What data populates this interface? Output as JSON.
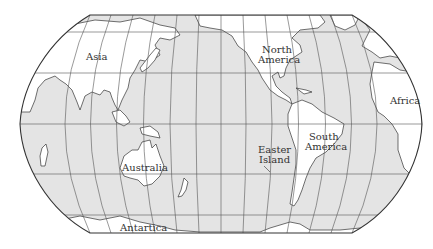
{
  "map": {
    "projection": "Pacific-centered world map (Robinson-like, flat poles)",
    "colors": {
      "ocean": "#e4e4e4",
      "land": "#ffffff",
      "coastline": "#333333",
      "graticule": "#555555",
      "border": "#333333",
      "background": "#ffffff"
    },
    "labels": {
      "asia": "Asia",
      "north_america": "North America",
      "north_america_line1": "North",
      "north_america_line2": "America",
      "africa": "Africa",
      "australia": "Australia",
      "south_america_line1": "South",
      "south_america_line2": "America",
      "easter_island_line1": "Easter",
      "easter_island_line2": "Island",
      "antarctica": "Antartica"
    },
    "graticule": {
      "parallels_y": [
        32,
        73,
        124,
        174,
        215
      ],
      "meridian_count": 12
    }
  }
}
